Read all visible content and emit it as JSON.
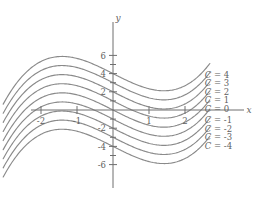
{
  "figure": {
    "axis_x_label": "x",
    "axis_y_label": "y",
    "stroke_color": "#8a8a8a",
    "axis_color": "#6e6e6e",
    "background": "#ffffff"
  },
  "chart_data": {
    "type": "line",
    "title": "",
    "xlabel": "x",
    "ylabel": "y",
    "xlim": [
      -3.2,
      3.1
    ],
    "ylim": [
      -7.2,
      7.2
    ],
    "grid": false,
    "legend_position": "right-inline",
    "x_ticks": [
      -2,
      -1,
      1,
      2
    ],
    "x_tick_labels": [
      "-2",
      "-1",
      "1",
      "2"
    ],
    "y_ticks": [
      -6,
      -4,
      -2,
      2,
      4,
      6
    ],
    "y_tick_labels": [
      "-6",
      "-4",
      "-2",
      "2",
      "4",
      "6"
    ],
    "minor_y_ticks": [
      -5,
      -3,
      -1,
      1,
      3,
      5
    ],
    "base_curve": {
      "form": "y = x^3/3 - 2x + C",
      "local_max_x": -1.41,
      "local_min_x": 1.41
    },
    "series": [
      {
        "name": "C = 4",
        "C": 4,
        "label": "C = 4",
        "label_x": 2.55,
        "label_y": 3.9
      },
      {
        "name": "C = 3",
        "C": 3,
        "label": "C = 3",
        "label_x": 2.55,
        "label_y": 2.95
      },
      {
        "name": "C = 2",
        "C": 2,
        "label": "C = 2",
        "label_x": 2.55,
        "label_y": 2.0
      },
      {
        "name": "C = 1",
        "C": 1,
        "label": "C = 1",
        "label_x": 2.55,
        "label_y": 1.05
      },
      {
        "name": "C = 0",
        "C": 0,
        "label": "C = 0",
        "label_x": 2.55,
        "label_y": 0.1
      },
      {
        "name": "C = -1",
        "C": -1,
        "label": "C = -1",
        "label_x": 2.55,
        "label_y": -1.1
      },
      {
        "name": "C = -2",
        "C": -2,
        "label": "C = -2",
        "label_x": 2.55,
        "label_y": -2.05
      },
      {
        "name": "C = -3",
        "C": -3,
        "label": "C = -3",
        "label_x": 2.55,
        "label_y": -3.0
      },
      {
        "name": "C = -4",
        "C": -4,
        "label": "C = -4",
        "label_x": 2.55,
        "label_y": -3.95
      }
    ]
  }
}
